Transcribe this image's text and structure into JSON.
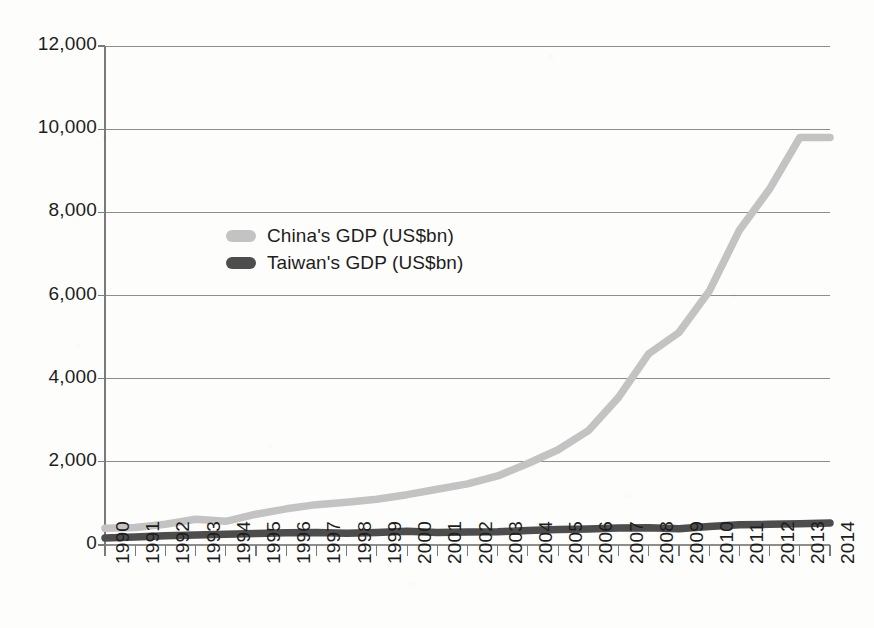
{
  "chart_data": {
    "type": "line",
    "title": "",
    "subtitle": "",
    "xlabel": "",
    "ylabel": "",
    "grid": "horizontal",
    "legend_position": "inside-upper-left",
    "xlim": [
      1990,
      2014
    ],
    "ylim": [
      0,
      12000
    ],
    "ytick_step": 2000,
    "x": [
      1990,
      1991,
      1992,
      1993,
      1994,
      1995,
      1996,
      1997,
      1998,
      1999,
      2000,
      2001,
      2002,
      2003,
      2004,
      2005,
      2006,
      2007,
      2008,
      2009,
      2010,
      2011,
      2012,
      2013,
      2014
    ],
    "categories": [
      "1990",
      "1991",
      "1992",
      "1993",
      "1994",
      "1995",
      "1996",
      "1997",
      "1998",
      "1999",
      "2000",
      "2001",
      "2002",
      "2003",
      "2004",
      "2005",
      "2006",
      "2007",
      "2008",
      "2009",
      "2010",
      "2011",
      "2012",
      "2013",
      "2014"
    ],
    "ytick_labels": [
      "0",
      "2,000",
      "4,000",
      "6,000",
      "8,000",
      "10,000",
      "12,000"
    ],
    "ytick_values": [
      0,
      2000,
      4000,
      6000,
      8000,
      10000,
      12000
    ],
    "series": [
      {
        "name": "China's GDP (US$bn)",
        "color": "#c3c3c3",
        "values": [
          400,
          420,
          500,
          620,
          570,
          740,
          870,
          970,
          1030,
          1100,
          1210,
          1340,
          1470,
          1660,
          1960,
          2290,
          2750,
          3550,
          4600,
          5110,
          6100,
          7570,
          8560,
          9800,
          9800
        ]
      },
      {
        "name": "Taiwan's GDP (US$bn)",
        "color": "#4d4d4d",
        "values": [
          170,
          190,
          225,
          240,
          256,
          279,
          293,
          303,
          280,
          303,
          331,
          299,
          310,
          318,
          346,
          375,
          387,
          408,
          415,
          392,
          446,
          485,
          498,
          513,
          530
        ]
      }
    ]
  },
  "legend": {
    "items": [
      {
        "label": "China's GDP (US$bn)",
        "color": "#c3c3c3"
      },
      {
        "label": "Taiwan's GDP (US$bn)",
        "color": "#4d4d4d"
      }
    ]
  },
  "axes": {
    "y_labels": [
      "12,000",
      "10,000",
      "8,000",
      "6,000",
      "4,000",
      "2,000",
      "0"
    ],
    "x_labels": [
      "1990",
      "1991",
      "1992",
      "1993",
      "1994",
      "1995",
      "1996",
      "1997",
      "1998",
      "1999",
      "2000",
      "2001",
      "2002",
      "2003",
      "2004",
      "2005",
      "2006",
      "2007",
      "2008",
      "2009",
      "2010",
      "2011",
      "2012",
      "2013",
      "2014"
    ]
  },
  "colors": {
    "background": "#fdfdfc",
    "grid": "#8d8d8d",
    "axis": "#7a7a7a",
    "text": "#1d1d1d",
    "china": "#c3c3c3",
    "taiwan": "#4d4d4d"
  }
}
